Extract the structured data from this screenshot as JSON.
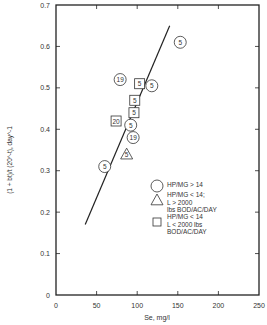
{
  "chart_data": {
    "type": "scatter",
    "title": "",
    "xlabel": "Se, mg/l",
    "ylabel": "(1 + bt)/t (20^-t), day^-1",
    "xlim": [
      0,
      250
    ],
    "ylim": [
      0,
      0.7
    ],
    "x_ticks": [
      "0",
      "50",
      "100",
      "150",
      "200",
      "250"
    ],
    "y_ticks": [
      "0",
      "0.1",
      "0.2",
      "0.3",
      "0.4",
      "0.5",
      "0.6",
      "0.7"
    ],
    "grid": false,
    "legend_position": "lower right inside",
    "legend": [
      {
        "marker": "circle",
        "label": "HP/MG > 14"
      },
      {
        "marker": "triangle",
        "label": "HP/MG < 14; L > 2000 lbs BOD/AC/DAY"
      },
      {
        "marker": "square",
        "label": "HP/MG < 14 L < 2000 lbs BOD/AC/DAY"
      }
    ],
    "series": [
      {
        "name": "HP/MG > 14",
        "marker": "circle",
        "points": [
          {
            "x": 153,
            "y": 0.61,
            "label": "5"
          },
          {
            "x": 79,
            "y": 0.52,
            "label": "19"
          },
          {
            "x": 118,
            "y": 0.505,
            "label": "5"
          },
          {
            "x": 92,
            "y": 0.41,
            "label": "5"
          },
          {
            "x": 95,
            "y": 0.38,
            "label": "19"
          },
          {
            "x": 60,
            "y": 0.31,
            "label": "5"
          }
        ]
      },
      {
        "name": "HP/MG < 14; L > 2000 lbs BOD/AC/DAY",
        "marker": "triangle",
        "points": [
          {
            "x": 87,
            "y": 0.34,
            "label": "5"
          }
        ]
      },
      {
        "name": "HP/MG < 14 L < 2000 lbs BOD/AC/DAY",
        "marker": "square",
        "points": [
          {
            "x": 103,
            "y": 0.51,
            "label": "5"
          },
          {
            "x": 97,
            "y": 0.47,
            "label": "5"
          },
          {
            "x": 96,
            "y": 0.44,
            "label": "5"
          },
          {
            "x": 74,
            "y": 0.42,
            "label": "20"
          }
        ]
      }
    ],
    "fit_line": {
      "x1": 36,
      "y1": 0.17,
      "x2": 140,
      "y2": 0.65
    }
  }
}
